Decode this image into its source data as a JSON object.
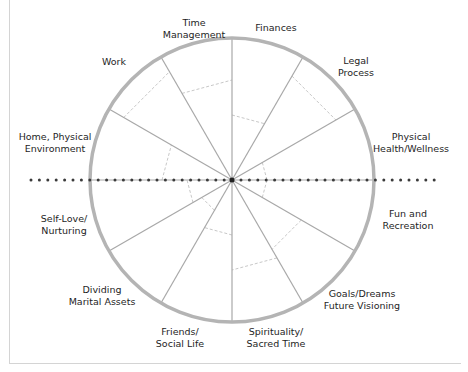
{
  "diagram": {
    "type": "wheel",
    "center": [
      232,
      180
    ],
    "radius": 142,
    "segments": 12,
    "colors": {
      "rim": "#b4b4b4",
      "spoke": "#a8a8a8",
      "arc": "#c8c8c8",
      "dots": "#3a3a3a",
      "text": "#1e1e1e",
      "frame": "#d4d4d4"
    },
    "labels": [
      {
        "id": "time-management",
        "lines": [
          "Time",
          "Management"
        ],
        "x": 194,
        "y": 17
      },
      {
        "id": "finances",
        "lines": [
          "Finances"
        ],
        "x": 276,
        "y": 22
      },
      {
        "id": "legal-process",
        "lines": [
          "Legal",
          "Process"
        ],
        "x": 356,
        "y": 55
      },
      {
        "id": "physical-health",
        "lines": [
          "Physical",
          "Health/Wellness"
        ],
        "x": 411,
        "y": 131
      },
      {
        "id": "fun-recreation",
        "lines": [
          "Fun and",
          "Recreation"
        ],
        "x": 408,
        "y": 208
      },
      {
        "id": "goals-dreams",
        "lines": [
          "Goals/Dreams",
          "Future Visioning"
        ],
        "x": 362,
        "y": 288
      },
      {
        "id": "spirituality",
        "lines": [
          "Spirituality/",
          "Sacred Time"
        ],
        "x": 276,
        "y": 326
      },
      {
        "id": "friends-social",
        "lines": [
          "Friends/",
          "Social Life"
        ],
        "x": 180,
        "y": 326
      },
      {
        "id": "dividing-assets",
        "lines": [
          "Dividing",
          "Marital Assets"
        ],
        "x": 102,
        "y": 284
      },
      {
        "id": "self-love",
        "lines": [
          "Self-Love/",
          "Nurturing"
        ],
        "x": 64,
        "y": 213
      },
      {
        "id": "home-environment",
        "lines": [
          "Home, Physical",
          "Environment"
        ],
        "x": 55,
        "y": 131
      },
      {
        "id": "work",
        "lines": [
          "Work"
        ],
        "x": 114,
        "y": 56
      }
    ],
    "rating_arcs": [
      {
        "from_deg": -90,
        "to_deg": -60,
        "radius": 65
      },
      {
        "from_deg": -60,
        "to_deg": -30,
        "radius": 120
      },
      {
        "from_deg": -30,
        "to_deg": 0,
        "radius": 35
      },
      {
        "from_deg": 0,
        "to_deg": 30,
        "radius": 35
      },
      {
        "from_deg": 30,
        "to_deg": 60,
        "radius": 80
      },
      {
        "from_deg": 60,
        "to_deg": 90,
        "radius": 90
      },
      {
        "from_deg": 90,
        "to_deg": 120,
        "radius": 55
      },
      {
        "from_deg": 120,
        "to_deg": 150,
        "radius": 35
      },
      {
        "from_deg": 150,
        "to_deg": 180,
        "radius": 45
      },
      {
        "from_deg": 180,
        "to_deg": 210,
        "radius": 70
      },
      {
        "from_deg": 210,
        "to_deg": 240,
        "radius": 125
      },
      {
        "from_deg": 240,
        "to_deg": 270,
        "radius": 100
      }
    ],
    "dotted_axis": {
      "x_start": 31,
      "x_end": 435,
      "y": 180,
      "spacing": 8.4
    }
  }
}
